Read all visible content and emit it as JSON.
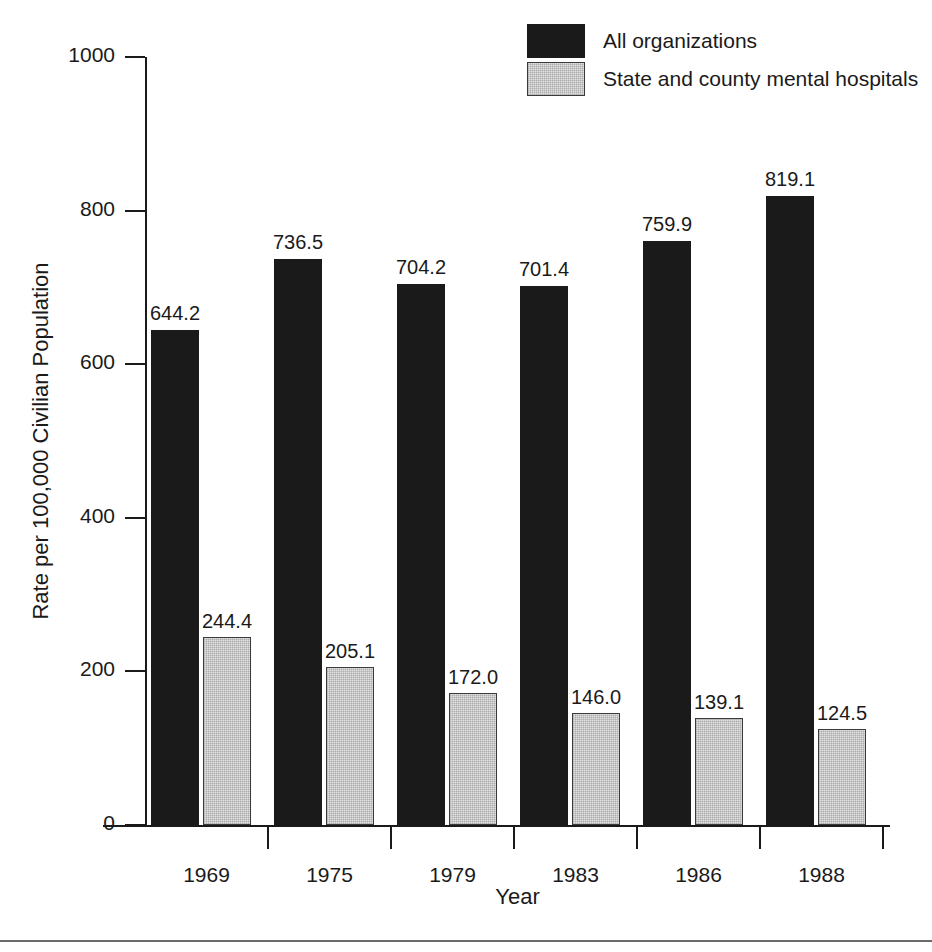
{
  "title_remnant": "",
  "legend": {
    "position": "top-right",
    "items": [
      {
        "label": "All organizations",
        "swatch": "dark-swatch",
        "color": "#1a1a1a"
      },
      {
        "label": "State and county mental hospitals",
        "swatch": "light-swatch",
        "color": "#e2e2e2"
      }
    ]
  },
  "chart_data": {
    "type": "bar",
    "title": "",
    "xlabel": "Year",
    "ylabel": "Rate per 100,000 Civilian Population",
    "categories": [
      "1969",
      "1975",
      "1979",
      "1983",
      "1986",
      "1988"
    ],
    "series": [
      {
        "name": "All organizations",
        "color": "#1a1a1a",
        "values": [
          644.2,
          736.5,
          704.2,
          701.4,
          759.9,
          819.1
        ],
        "labels": [
          "644.2",
          "736.5",
          "704.2",
          "701.4",
          "759.9",
          "819.1"
        ]
      },
      {
        "name": "State and county mental hospitals",
        "color": "#e2e2e2",
        "values": [
          244.4,
          205.1,
          172.0,
          146.0,
          139.1,
          124.5
        ],
        "labels": [
          "244.4",
          "205.1",
          "172.0",
          "146.0",
          "139.1",
          "124.5"
        ]
      }
    ],
    "ylim": [
      0,
      1000
    ],
    "yticks": [
      0,
      200,
      400,
      600,
      800,
      1000
    ],
    "ytick_labels": [
      "0",
      "200",
      "400",
      "600",
      "800",
      "1000"
    ],
    "grid": false,
    "legend_position": "top-right"
  }
}
